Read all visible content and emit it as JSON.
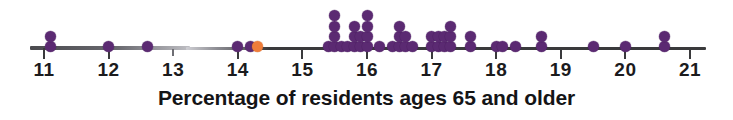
{
  "chart_data": {
    "type": "scatter",
    "plot_kind": "dotplot",
    "title": "",
    "xlabel": "Percentage of residents ages 65 and older",
    "ylabel": "",
    "xlim": [
      10.6,
      21.3
    ],
    "grid": false,
    "legend": false,
    "xticks": [
      11,
      12,
      13,
      14,
      15,
      16,
      17,
      18,
      19,
      20,
      21
    ],
    "xtick_labels": [
      "11",
      "12",
      "13",
      "14",
      "15",
      "16",
      "17",
      "18",
      "19",
      "20",
      "21"
    ],
    "dot_value_step": 0.1,
    "series": [
      {
        "name": "states",
        "color": "#5b2a72",
        "stacks": [
          {
            "x": 11.1,
            "count": 2
          },
          {
            "x": 12.0,
            "count": 1
          },
          {
            "x": 12.6,
            "count": 1
          },
          {
            "x": 14.0,
            "count": 1
          },
          {
            "x": 14.2,
            "count": 1
          },
          {
            "x": 15.4,
            "count": 1
          },
          {
            "x": 15.5,
            "count": 4
          },
          {
            "x": 15.6,
            "count": 1
          },
          {
            "x": 15.7,
            "count": 1
          },
          {
            "x": 15.8,
            "count": 3
          },
          {
            "x": 15.9,
            "count": 2
          },
          {
            "x": 16.0,
            "count": 4
          },
          {
            "x": 16.2,
            "count": 1
          },
          {
            "x": 16.4,
            "count": 1
          },
          {
            "x": 16.5,
            "count": 3
          },
          {
            "x": 16.6,
            "count": 2
          },
          {
            "x": 16.7,
            "count": 1
          },
          {
            "x": 17.0,
            "count": 2
          },
          {
            "x": 17.1,
            "count": 2
          },
          {
            "x": 17.2,
            "count": 2
          },
          {
            "x": 17.3,
            "count": 3
          },
          {
            "x": 17.6,
            "count": 2
          },
          {
            "x": 18.0,
            "count": 1
          },
          {
            "x": 18.1,
            "count": 1
          },
          {
            "x": 18.3,
            "count": 1
          },
          {
            "x": 18.7,
            "count": 2
          },
          {
            "x": 19.5,
            "count": 1
          },
          {
            "x": 20.0,
            "count": 1
          },
          {
            "x": 20.6,
            "count": 2
          }
        ]
      },
      {
        "name": "highlighted-state",
        "color": "#ef7d3a",
        "stacks": [
          {
            "x": 14.3,
            "count": 1
          }
        ]
      }
    ]
  },
  "axis": {
    "label": "Percentage of residents ages 65 and older"
  },
  "colors": {
    "dot": "#5b2a72",
    "dot_highlight": "#ef7d3a",
    "axis": "#3a3a3c",
    "text": "#141416"
  }
}
